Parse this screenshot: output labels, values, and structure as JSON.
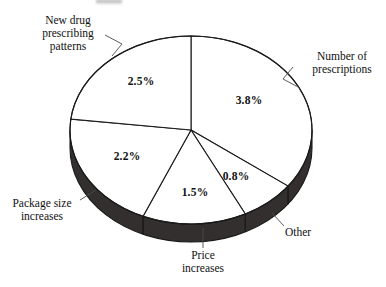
{
  "chart_data": {
    "type": "pie",
    "title": "",
    "subtitle": "",
    "xlabel": "",
    "ylabel": "",
    "legend_position": "callout-labels",
    "grid": false,
    "unit": "%",
    "total": 10.8,
    "categories": [
      "Number of prescriptions",
      "Other",
      "Price increases",
      "Package size increases",
      "New drug prescribing patterns"
    ],
    "values": [
      3.8,
      0.8,
      1.5,
      2.2,
      2.5
    ],
    "slices": [
      {
        "label": "Number of prescriptions",
        "value": 3.8,
        "value_text": "3.8%",
        "label_lines": [
          "Number of",
          "prescriptions"
        ],
        "start_deg": 0,
        "end_deg": 126.67,
        "face_color": "#ffffff",
        "pct_x": 249,
        "pct_y": 104
      },
      {
        "label": "Other",
        "value": 0.8,
        "value_text": "0.8%",
        "label_lines": [
          "Other"
        ],
        "start_deg": 126.67,
        "end_deg": 153.33,
        "face_color": "#ffffff",
        "pct_x": 236,
        "pct_y": 180
      },
      {
        "label": "Price increases",
        "value": 1.5,
        "value_text": "1.5%",
        "label_lines": [
          "Price",
          "increases"
        ],
        "start_deg": 153.33,
        "end_deg": 203.33,
        "face_color": "#ffffff",
        "pct_x": 195,
        "pct_y": 196
      },
      {
        "label": "Package size increases",
        "value": 2.2,
        "value_text": "2.2%",
        "label_lines": [
          "Package size",
          "increases"
        ],
        "start_deg": 203.33,
        "end_deg": 276.67,
        "face_color": "#ffffff",
        "pct_x": 127,
        "pct_y": 160
      },
      {
        "label": "New drug prescribing patterns",
        "value": 2.5,
        "value_text": "2.5%",
        "label_lines": [
          "New drug",
          "prescribing",
          "patterns"
        ],
        "start_deg": 276.67,
        "end_deg": 360,
        "face_color": "#ffffff",
        "pct_x": 141,
        "pct_y": 85
      }
    ],
    "style": {
      "three_d": true,
      "rim_color": "#332f2f",
      "outline_color": "#1a1a1a",
      "background": "#ffffff"
    }
  },
  "callouts": {
    "new_drug": {
      "lines": [
        "New drug",
        "prescribing",
        "patterns"
      ]
    },
    "number_of_prescriptions": {
      "lines": [
        "Number of",
        "prescriptions"
      ]
    },
    "package_size": {
      "lines": [
        "Package size",
        "increases"
      ]
    },
    "price_increases": {
      "lines": [
        "Price",
        "increases"
      ]
    },
    "other": {
      "lines": [
        "Other"
      ]
    }
  }
}
